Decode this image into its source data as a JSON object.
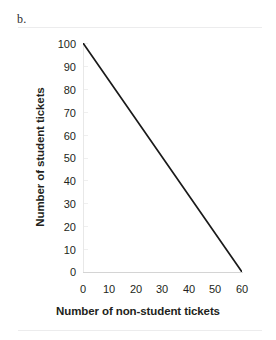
{
  "figure": {
    "label": "b."
  },
  "chart_data": {
    "type": "line",
    "title": "",
    "subtitle": "",
    "xlabel": "Number of non-student tickets",
    "ylabel": "Number of student tickets",
    "xlim": [
      0,
      60
    ],
    "ylim": [
      0,
      100
    ],
    "xticks": [
      "0",
      "10",
      "20",
      "30",
      "40",
      "50",
      "60"
    ],
    "yticks": [
      "0",
      "10",
      "20",
      "30",
      "40",
      "50",
      "60",
      "70",
      "80",
      "90",
      "100"
    ],
    "grid": false,
    "legend": null,
    "annotations": [],
    "line_color": "#1a1a1a",
    "series": [
      {
        "name": "budget constraint",
        "x": [
          0,
          60
        ],
        "values": [
          100,
          0
        ]
      }
    ]
  }
}
